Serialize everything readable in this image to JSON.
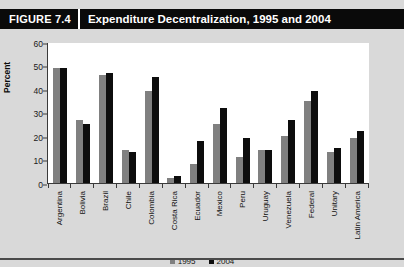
{
  "header": {
    "figure_label": "FIGURE 7.4",
    "title": "Expenditure Decentralization, 1995 and 2004"
  },
  "colors": {
    "series_1995": "#808080",
    "series_2004": "#0d0d0d",
    "titlebar_bg": "#0a0a0a",
    "panel_bg": "#d9d9d9",
    "plot_bg": "#ffffff",
    "axis": "#3a3a3a"
  },
  "legend": {
    "position": "bottom-center",
    "items": [
      {
        "label": "1995",
        "color": "#808080"
      },
      {
        "label": "2004",
        "color": "#0d0d0d"
      }
    ]
  },
  "chart_data": {
    "type": "bar",
    "title": "Expenditure Decentralization, 1995 and 2004",
    "xlabel": "",
    "ylabel": "Percent",
    "ylim": [
      0,
      60
    ],
    "yticks": [
      0,
      10,
      20,
      30,
      40,
      50,
      60
    ],
    "grid": false,
    "categories": [
      "Argentina",
      "Bolivia",
      "Brazil",
      "Chile",
      "Colombia",
      "Costa Rica",
      "Ecuador",
      "Mexico",
      "Peru",
      "Uruguay",
      "Venezuela",
      "Federal",
      "Unitary",
      "Latin America"
    ],
    "series": [
      {
        "name": "1995",
        "color": "#808080",
        "values": [
          49,
          27,
          46,
          14,
          39,
          2,
          8,
          25,
          11,
          14,
          20,
          35,
          13,
          19
        ]
      },
      {
        "name": "2004",
        "color": "#0d0d0d",
        "values": [
          49,
          25,
          47,
          13,
          45,
          3,
          18,
          32,
          19,
          14,
          27,
          39,
          15,
          22
        ]
      }
    ]
  }
}
